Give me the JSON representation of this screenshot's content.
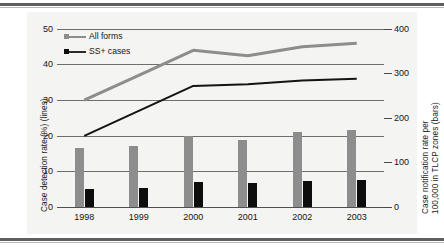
{
  "chart_data": {
    "type": "bar",
    "title": "",
    "subtitle": "",
    "categories": [
      "1998",
      "1999",
      "2000",
      "2001",
      "2002",
      "2003"
    ],
    "xlabel": "",
    "ylabel": "Case detection rate (%) (lines)",
    "ylabel_secondary": "Case notification rate per 100,000 in TLCP zones (bars)",
    "ylim": [
      0,
      50
    ],
    "ylim_secondary": [
      0,
      400
    ],
    "yticks": [
      "0",
      "10",
      "20",
      "30",
      "40",
      "50"
    ],
    "yticks_secondary": [
      "0",
      "100",
      "200",
      "300",
      "400"
    ],
    "grid": true,
    "legend_position": "upper-left",
    "series": [
      {
        "name": "All forms",
        "kind": "bar",
        "axis": "secondary",
        "color": "#8d8d8d",
        "values": [
          132,
          136,
          160,
          150,
          168,
          172
        ]
      },
      {
        "name": "SS+ cases",
        "kind": "bar",
        "axis": "secondary",
        "color": "#0d0d0d",
        "values": [
          40,
          42,
          56,
          54,
          58,
          60
        ]
      },
      {
        "name": "All forms",
        "kind": "line",
        "axis": "primary",
        "color": "#8d8d8d",
        "values": [
          30,
          37,
          44,
          42.5,
          45,
          46
        ]
      },
      {
        "name": "SS+ cases",
        "kind": "line",
        "axis": "primary",
        "color": "#141414",
        "values": [
          20,
          27,
          34,
          34.5,
          35.5,
          36
        ]
      }
    ]
  },
  "axes": {
    "left": {
      "title": "Case detection rate (%) (lines)",
      "ticks": [
        {
          "label": "50",
          "value": 50
        },
        {
          "label": "40",
          "value": 40
        },
        {
          "label": "30",
          "value": 30
        },
        {
          "label": "20",
          "value": 20
        },
        {
          "label": "10",
          "value": 10
        },
        {
          "label": "0",
          "value": 0
        }
      ]
    },
    "right": {
      "title_line1": "Case notification rate per",
      "title_line2": "100,000 in TLCP zones (bars)",
      "ticks": [
        {
          "label": "400",
          "value": 400
        },
        {
          "label": "300",
          "value": 300
        },
        {
          "label": "200",
          "value": 200
        },
        {
          "label": "100",
          "value": 100
        },
        {
          "label": "0",
          "value": 0
        }
      ]
    },
    "x": {
      "categories": [
        "1998",
        "1999",
        "2000",
        "2001",
        "2002",
        "2003"
      ]
    }
  },
  "legend": {
    "items": [
      {
        "label": "All forms",
        "color": "#8d8d8d"
      },
      {
        "label": "SS+ cases",
        "color": "#0d0d0d"
      }
    ]
  }
}
